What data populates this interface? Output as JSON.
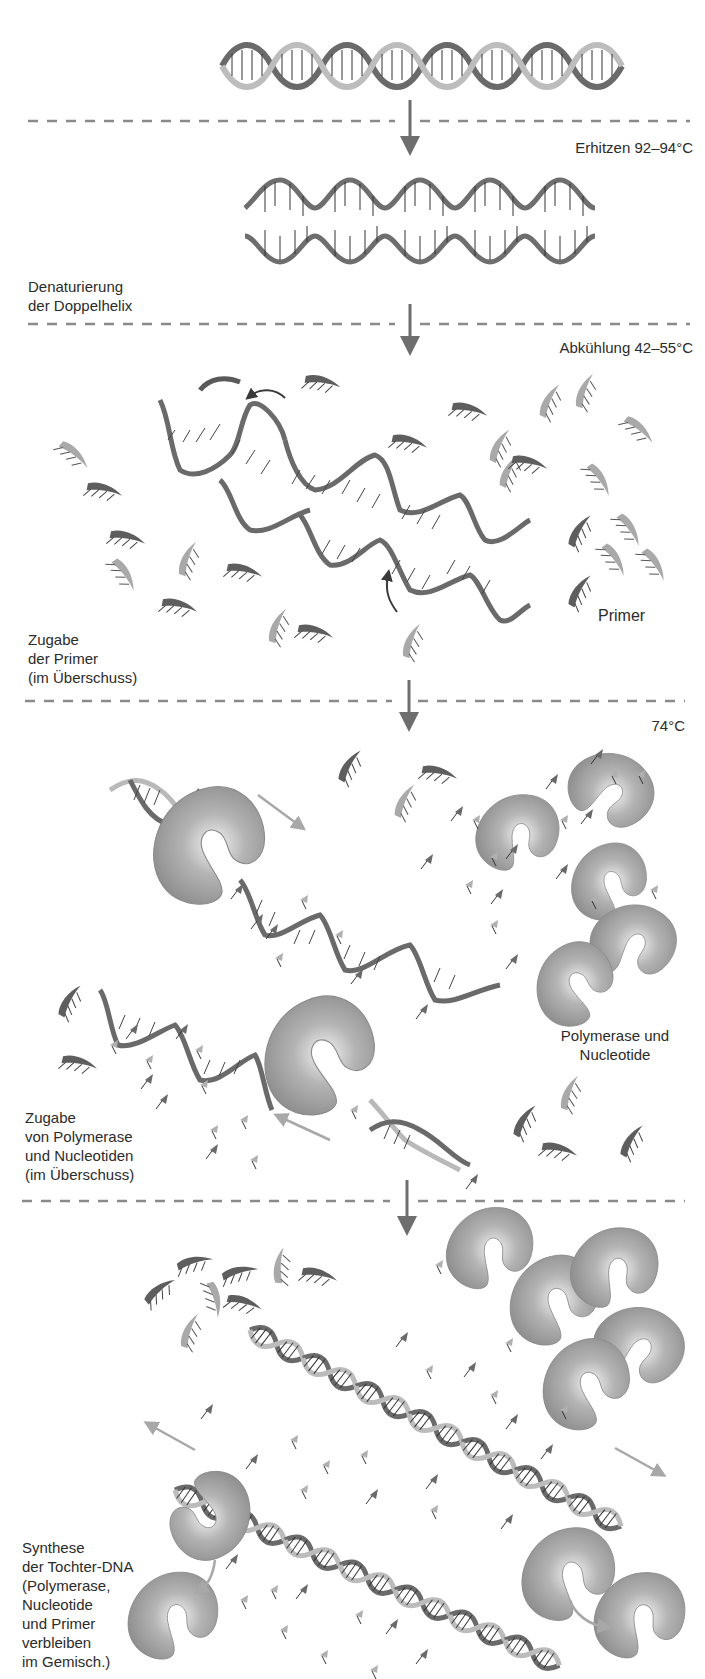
{
  "diagram": {
    "topic": "PCR (Polymerase-Kettenreaktion) Ablauf",
    "colors": {
      "dashed_line": "#8a8a8a",
      "step_arrow": "#6e6e6e",
      "dna_dark": "#6a6a6a",
      "dna_light": "#b9b9b9",
      "polymerase": "#9c9c9c",
      "motion_arrow": "#a8a8a8",
      "text": "#2b2b2b"
    },
    "steps": [
      {
        "id": "heating",
        "temperature_label": "Erhitzen 92–94°C",
        "stage_label": [
          "Denaturierung",
          "der Doppelhelix"
        ]
      },
      {
        "id": "cooling",
        "temperature_label": "Abkühlung 42–55°C",
        "stage_label": [
          "Zugabe",
          "der Primer",
          "(im Überschuss)"
        ],
        "annotation": "Primer"
      },
      {
        "id": "extension",
        "temperature_label": "74°C",
        "stage_label": [
          "Zugabe",
          "von Polymerase",
          "und Nucleotiden",
          "(im Überschuss)"
        ],
        "annotation": [
          "Polymerase und",
          "Nucleotide"
        ]
      },
      {
        "id": "synthesis",
        "stage_label": [
          "Synthese",
          "der Tochter-DNA",
          "(Polymerase,",
          "Nucleotide",
          "und Primer",
          "verbleiben",
          "im Gemisch.)"
        ]
      }
    ]
  }
}
